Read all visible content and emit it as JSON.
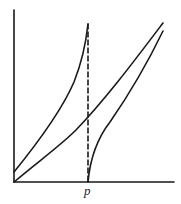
{
  "diagram": {
    "axis_label_x_mark": "p",
    "colors": {
      "stroke": "#1a1a1a",
      "background": "#ffffff"
    },
    "curves": [
      {
        "name": "left-convex-curve",
        "description": "rises from vertical axis just above origin, steepening to top of dashed line at p"
      },
      {
        "name": "diagonal-line",
        "description": "near-straight line from origin to upper right"
      },
      {
        "name": "right-concave-curve",
        "description": "rises from p on x-axis, concave, to upper right"
      }
    ],
    "dashed_line": {
      "at": "p",
      "description": "vertical asymptote"
    }
  }
}
